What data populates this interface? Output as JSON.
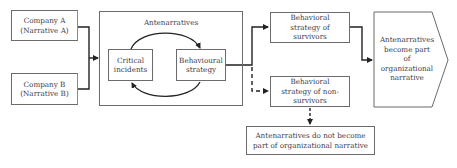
{
  "nodes": {
    "company_a": {
      "line1": "Company A",
      "line2": "(Narrative A)"
    },
    "company_b": {
      "line1": "Company B",
      "line2": "(Narrative B)"
    },
    "antenarratives": {
      "title": "Antenarratives"
    },
    "critical_incidents": {
      "line1": "Critical",
      "line2": "incidents"
    },
    "behavioural_strategy": {
      "line1": "Behavioural",
      "line2": "strategy"
    },
    "survivors": {
      "line1": "Behavioral",
      "line2": "strategy of",
      "line3": "survivors"
    },
    "non_survivors": {
      "line1": "Behavioral",
      "line2": "strategy of non-",
      "line3": "survivors"
    },
    "become_part": {
      "line1": "Antenarratives",
      "line2": "become part",
      "line3": "of",
      "line4": "organizational",
      "line5": "narrative"
    },
    "not_become_part": {
      "line1": "Antenarratives do not become",
      "line2": "part of organizational narrative"
    }
  },
  "edges": [
    {
      "from": "company_a",
      "to": "antenarratives",
      "style": "solid"
    },
    {
      "from": "company_b",
      "to": "antenarratives",
      "style": "solid"
    },
    {
      "from": "critical_incidents",
      "to": "behavioural_strategy",
      "style": "solid",
      "curved": true
    },
    {
      "from": "behavioural_strategy",
      "to": "critical_incidents",
      "style": "solid",
      "curved": true
    },
    {
      "from": "behavioural_strategy",
      "to": "survivors",
      "style": "solid"
    },
    {
      "from": "behavioural_strategy",
      "to": "non_survivors",
      "style": "dashed"
    },
    {
      "from": "survivors",
      "to": "become_part",
      "style": "solid"
    },
    {
      "from": "non_survivors",
      "to": "not_become_part",
      "style": "dashed"
    }
  ],
  "colors": {
    "line": "#222222",
    "border": "#6b6b6b",
    "accent_border": "#d46a78",
    "text": "#3a3a4a"
  }
}
